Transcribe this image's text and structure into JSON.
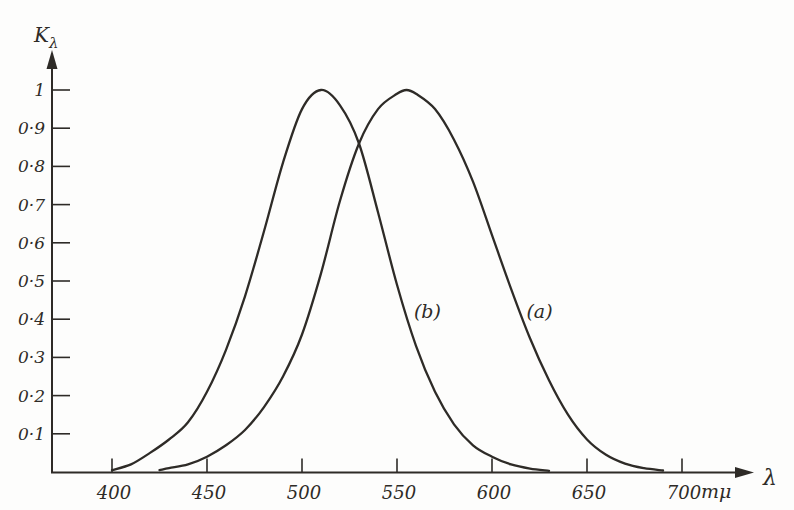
{
  "figure": {
    "background": "#fdfdfc",
    "ink_color": "#2e2b27"
  },
  "chart_data": {
    "type": "line",
    "title": "",
    "ylabel_main": "K",
    "ylabel_sub": "λ",
    "xlabel_arrow": "λ",
    "x_unit_label": "mμ",
    "xlim": [
      370,
      735
    ],
    "ylim": [
      0,
      1.1
    ],
    "grid": false,
    "legend_position": "inline-annotations",
    "y_ticks": [
      {
        "value": 1.0,
        "label": "1"
      },
      {
        "value": 0.9,
        "label": "0·9"
      },
      {
        "value": 0.8,
        "label": "0·8"
      },
      {
        "value": 0.7,
        "label": "0·7"
      },
      {
        "value": 0.6,
        "label": "0·6"
      },
      {
        "value": 0.5,
        "label": "0·5"
      },
      {
        "value": 0.4,
        "label": "0·4"
      },
      {
        "value": 0.3,
        "label": "0·3"
      },
      {
        "value": 0.2,
        "label": "0·2"
      },
      {
        "value": 0.1,
        "label": "0·1"
      }
    ],
    "x_ticks": [
      {
        "value": 400,
        "label": "400"
      },
      {
        "value": 450,
        "label": "450"
      },
      {
        "value": 500,
        "label": "500"
      },
      {
        "value": 550,
        "label": "550"
      },
      {
        "value": 600,
        "label": "600"
      },
      {
        "value": 650,
        "label": "650"
      },
      {
        "value": 700,
        "label": "700"
      }
    ],
    "series": [
      {
        "name": "(a)",
        "peak_wavelength": 555,
        "x": [
          425,
          430,
          440,
          450,
          460,
          470,
          480,
          490,
          500,
          510,
          520,
          530,
          540,
          550,
          555,
          560,
          570,
          580,
          590,
          600,
          610,
          620,
          630,
          640,
          650,
          660,
          670,
          680,
          690
        ],
        "y": [
          0.005,
          0.01,
          0.02,
          0.04,
          0.07,
          0.11,
          0.17,
          0.25,
          0.36,
          0.52,
          0.71,
          0.86,
          0.95,
          0.99,
          1.0,
          0.99,
          0.95,
          0.87,
          0.76,
          0.62,
          0.48,
          0.35,
          0.24,
          0.15,
          0.085,
          0.045,
          0.022,
          0.01,
          0.004
        ]
      },
      {
        "name": "(b)",
        "peak_wavelength": 510,
        "x": [
          400,
          410,
          420,
          430,
          440,
          450,
          460,
          470,
          480,
          490,
          500,
          510,
          520,
          530,
          540,
          550,
          560,
          570,
          580,
          590,
          600,
          610,
          620,
          630
        ],
        "y": [
          0.005,
          0.02,
          0.05,
          0.085,
          0.13,
          0.21,
          0.32,
          0.46,
          0.63,
          0.81,
          0.95,
          1.0,
          0.96,
          0.86,
          0.68,
          0.49,
          0.33,
          0.21,
          0.125,
          0.07,
          0.04,
          0.02,
          0.009,
          0.003
        ]
      }
    ],
    "annotations": [
      {
        "text": "(b)",
        "x": 566,
        "y": 0.42
      },
      {
        "text": "(a)",
        "x": 625,
        "y": 0.42
      }
    ],
    "crossing_point": {
      "x": 530,
      "y": 0.86
    }
  }
}
